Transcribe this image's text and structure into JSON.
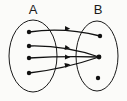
{
  "diagram": {
    "type": "mapping-diagram",
    "title": "",
    "sets": [
      {
        "id": "A",
        "label": "A",
        "label_x": 33,
        "label_y": 14,
        "oval": {
          "cx": 33,
          "cy": 56,
          "rx": 24,
          "ry": 36
        },
        "elements": [
          {
            "id": "a1",
            "cx": 29,
            "cy": 32
          },
          {
            "id": "a2",
            "cx": 29,
            "cy": 46
          },
          {
            "id": "a3",
            "cx": 29,
            "cy": 58
          },
          {
            "id": "a4",
            "cx": 29,
            "cy": 73
          }
        ]
      },
      {
        "id": "B",
        "label": "B",
        "label_x": 98,
        "label_y": 14,
        "oval": {
          "cx": 97,
          "cy": 56,
          "rx": 21,
          "ry": 35
        },
        "elements": [
          {
            "id": "b1",
            "cx": 100,
            "cy": 36
          },
          {
            "id": "b2",
            "cx": 99,
            "cy": 57
          },
          {
            "id": "b3",
            "cx": 98,
            "cy": 78
          }
        ]
      }
    ],
    "edges": [
      {
        "id": "edge-a1-b1",
        "from": "a1",
        "to": "b1",
        "path": "M 29 32 Q 64 27 100 36",
        "arrow_x": 65,
        "arrow_y": 28.5,
        "arrow_angle": 3
      },
      {
        "id": "edge-a2-b2",
        "from": "a2",
        "to": "b2",
        "path": "M 29 46 Q 64 45 99 57",
        "arrow_x": 65,
        "arrow_y": 47.5,
        "arrow_angle": 9
      },
      {
        "id": "edge-a3-b2",
        "from": "a3",
        "to": "b2",
        "path": "M 29 58 Q 64 56 99 57",
        "arrow_x": 65,
        "arrow_y": 57,
        "arrow_angle": 2
      },
      {
        "id": "edge-a4-b2",
        "from": "a4",
        "to": "b2",
        "path": "M 29 73 Q 64 69 99 57",
        "arrow_x": 65,
        "arrow_y": 65.5,
        "arrow_angle": -13
      }
    ],
    "unmapped_elements": [
      "b3"
    ],
    "colors": {
      "stroke": "#111111",
      "dot": "#111111",
      "label": "#1a1a1a",
      "background": "#fbfbf9"
    }
  }
}
